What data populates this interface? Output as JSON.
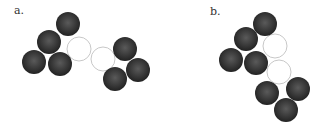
{
  "panels": [
    {
      "label": "a.",
      "label_pos": [
        14,
        4
      ],
      "dark_spheres": [
        [
          68,
          24
        ],
        [
          49,
          42
        ],
        [
          34,
          62
        ],
        [
          60,
          64
        ],
        [
          125,
          49
        ],
        [
          138,
          70
        ],
        [
          115,
          79
        ]
      ],
      "hollow_spheres": [
        [
          79,
          49
        ],
        [
          103,
          59
        ]
      ]
    },
    {
      "label": "b.",
      "label_pos": [
        210,
        5
      ],
      "dark_spheres": [
        [
          265,
          24
        ],
        [
          246,
          39
        ],
        [
          231,
          60
        ],
        [
          256,
          63
        ],
        [
          267,
          93
        ],
        [
          298,
          89
        ],
        [
          286,
          110
        ]
      ],
      "hollow_spheres": [
        [
          275,
          46
        ],
        [
          279,
          72
        ]
      ]
    }
  ],
  "sphere_radius": 12,
  "colors": {
    "dark": "#2e2e2e",
    "highlight": "#5a5a5a",
    "hollow_stroke": "#c8c8c8"
  }
}
